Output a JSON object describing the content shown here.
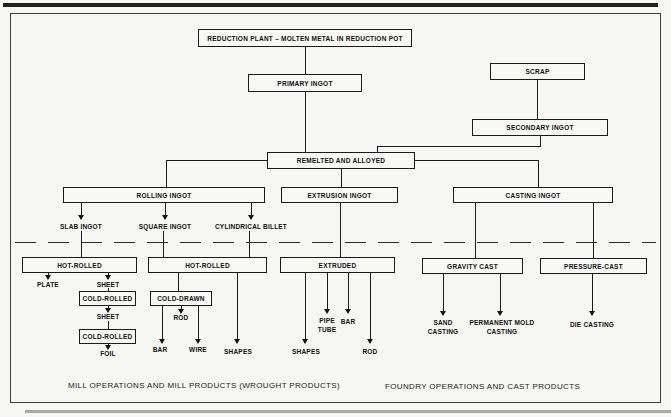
{
  "diagram": {
    "nodes": {
      "reduction_plant": "REDUCTION PLANT – MOLTEN METAL IN REDUCTION POT",
      "primary_ingot": "PRIMARY INGOT",
      "scrap": "SCRAP",
      "secondary_ingot": "SECONDARY INGOT",
      "remelted_and_alloyed": "REMELTED AND ALLOYED",
      "rolling_ingot": "ROLLING INGOT",
      "extrusion_ingot": "EXTRUSION INGOT",
      "casting_ingot": "CASTING INGOT",
      "hot_rolled_left": "HOT-ROLLED",
      "hot_rolled_mid": "HOT-ROLLED",
      "extruded": "EXTRUDED",
      "gravity_cast": "GRAVITY CAST",
      "pressure_cast": "PRESSURE-CAST",
      "cold_rolled_upper": "COLD-ROLLED",
      "cold_drawn": "COLD-DRAWN",
      "cold_rolled_lower": "COLD-ROLLED"
    },
    "labels": {
      "slab_ingot": "SLAB INGOT",
      "square_ingot": "SQUARE INGOT",
      "cylindrical_billet": "CYLINDRICAL BILLET",
      "plate": "PLATE",
      "sheet_hot": "SHEET",
      "sheet_cold": "SHEET",
      "foil": "FOIL",
      "rod_drawn": "ROD",
      "bar_drawn": "BAR",
      "wire": "WIRE",
      "shapes_drawn": "SHAPES",
      "pipe": "PIPE",
      "tube": "TUBE",
      "bar_extruded": "BAR",
      "shapes_extruded": "SHAPES",
      "rod_extruded": "ROD",
      "sand_casting_line1": "SAND",
      "sand_casting_line2": "CASTING",
      "permanent_mold_line1": "PERMANENT MOLD",
      "permanent_mold_line2": "CASTING",
      "die_casting": "DIE CASTING"
    },
    "captions": {
      "left": "MILL OPERATIONS AND MILL PRODUCTS (WROUGHT PRODUCTS)",
      "right": "FOUNDRY OPERATIONS AND CAST PRODUCTS"
    },
    "colors": {
      "line": "#1b1b1b",
      "background": "#f6f6f2"
    }
  }
}
